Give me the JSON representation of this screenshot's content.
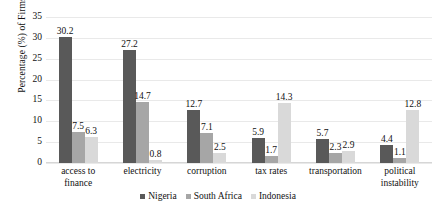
{
  "chart_data": {
    "type": "bar",
    "title": "",
    "subtitle": "",
    "xlabel": "",
    "ylabel": "Percentage (%) of Firms",
    "ylim": [
      0,
      35
    ],
    "yticks": [
      35,
      30,
      25,
      20,
      15,
      10,
      5,
      0
    ],
    "grid": true,
    "legend_position": "bottom",
    "categories": [
      "access to finance",
      "electricity",
      "corruption",
      "tax rates",
      "transportation",
      "political instability"
    ],
    "category_lines": [
      [
        "access to",
        "finance"
      ],
      [
        "electricity"
      ],
      [
        "corruption"
      ],
      [
        "tax rates"
      ],
      [
        "transportation"
      ],
      [
        "political",
        "instability"
      ]
    ],
    "series": [
      {
        "name": "Nigeria",
        "color": "#595959",
        "values": [
          30.2,
          27.2,
          12.7,
          5.9,
          5.7,
          4.4
        ]
      },
      {
        "name": "South Africa",
        "color": "#a6a6a6",
        "values": [
          7.5,
          14.7,
          7.1,
          1.7,
          2.3,
          1.1
        ]
      },
      {
        "name": "Indonesia",
        "color": "#d9d9d9",
        "values": [
          6.3,
          0.8,
          2.5,
          14.3,
          2.9,
          12.8
        ]
      }
    ],
    "data_labels": [
      [
        "30.2",
        "7.5",
        "6.3"
      ],
      [
        "27.2",
        "14.7",
        "0.8"
      ],
      [
        "12.7",
        "7.1",
        "2.5"
      ],
      [
        "5.9",
        "1.7",
        "14.3"
      ],
      [
        "5.7",
        "2.3",
        "2.9"
      ],
      [
        "4.4",
        "1.1",
        "12.8"
      ]
    ]
  },
  "colors": {
    "gridline": "#e9e9e9",
    "text": "#111111",
    "background": "#ffffff"
  }
}
